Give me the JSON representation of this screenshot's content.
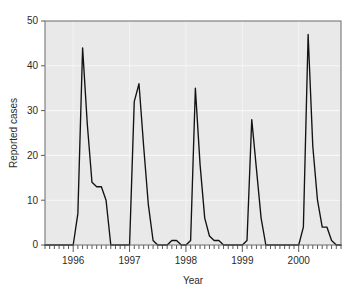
{
  "chart_data": {
    "type": "line",
    "title": "",
    "xlabel": "Year",
    "ylabel": "Reported cases",
    "xlim": [
      1995.5,
      2000.75
    ],
    "ylim": [
      0,
      50
    ],
    "grid": true,
    "grid_values": [
      10,
      20,
      30,
      40
    ],
    "legend": "none",
    "plot_background": "#e9e9e9",
    "line_color": "#121212",
    "axis_color": "#5a5a5a",
    "yticks": [
      0,
      10,
      20,
      30,
      40,
      50
    ],
    "ytick_labels": [
      "0",
      "10",
      "20",
      "30",
      "40",
      "50"
    ],
    "xticks": [
      1996,
      1997,
      1998,
      1999,
      2000
    ],
    "xtick_labels": [
      "1996",
      "1997",
      "1998",
      "1999",
      "2000"
    ],
    "minor_xtick_interval_months": 1,
    "x": [
      1995.5,
      1995.583,
      1995.667,
      1995.75,
      1995.833,
      1995.917,
      1996.0,
      1996.083,
      1996.167,
      1996.25,
      1996.333,
      1996.417,
      1996.5,
      1996.583,
      1996.667,
      1996.75,
      1996.833,
      1996.917,
      1997.0,
      1997.083,
      1997.167,
      1997.25,
      1997.333,
      1997.417,
      1997.5,
      1997.583,
      1997.667,
      1997.75,
      1997.833,
      1997.917,
      1998.0,
      1998.083,
      1998.167,
      1998.25,
      1998.333,
      1998.417,
      1998.5,
      1998.583,
      1998.667,
      1998.75,
      1998.833,
      1998.917,
      1999.0,
      1999.083,
      1999.167,
      1999.25,
      1999.333,
      1999.417,
      1999.5,
      1999.583,
      1999.667,
      1999.75,
      1999.833,
      1999.917,
      2000.0,
      2000.083,
      2000.167,
      2000.25,
      2000.333,
      2000.417,
      2000.5,
      2000.583,
      2000.667,
      2000.75
    ],
    "y": [
      0,
      0,
      0,
      0,
      0,
      0,
      0,
      7,
      44,
      27,
      14,
      13,
      13,
      10,
      0,
      0,
      0,
      0,
      0,
      32,
      36,
      22,
      9,
      1,
      0,
      0,
      0,
      1,
      1,
      0,
      0,
      1,
      35,
      18,
      6,
      2,
      1,
      1,
      0,
      0,
      0,
      0,
      0,
      1,
      28,
      17,
      6,
      0,
      0,
      0,
      0,
      0,
      0,
      0,
      0,
      4,
      47,
      22,
      10,
      4,
      4,
      1,
      0,
      0
    ],
    "series": [
      {
        "name": "Reported cases",
        "color": "#121212",
        "peaks": [
          {
            "year": 1996,
            "value": 44
          },
          {
            "year": 1997,
            "value": 36
          },
          {
            "year": 1998,
            "value": 35
          },
          {
            "year": 1999,
            "value": 28
          },
          {
            "year": 2000,
            "value": 47
          }
        ]
      }
    ]
  }
}
